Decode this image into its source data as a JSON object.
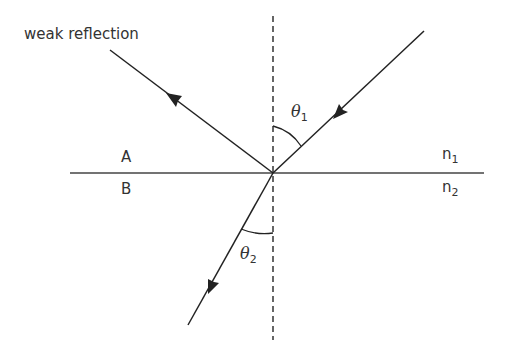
{
  "labels": {
    "reflection": "weak reflection",
    "medium_a": "A",
    "medium_b": "B",
    "n1_base": "n",
    "n1_sub": "1",
    "n2_base": "n",
    "n2_sub": "2",
    "theta1_base": "θ",
    "theta1_sub": "1",
    "theta2_base": "θ",
    "theta2_sub": "2"
  },
  "colors": {
    "line": "#222222",
    "text": "#333333",
    "background": "#ffffff"
  }
}
